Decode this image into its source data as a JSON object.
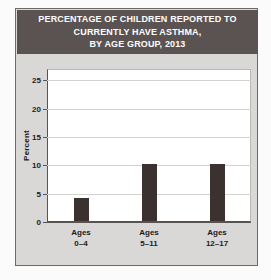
{
  "figure": {
    "title_lines": [
      "PERCENTAGE OF CHILDREN REPORTED TO",
      "CURRENTLY HAVE ASTHMA,",
      "BY AGE GROUP, 2013"
    ],
    "title_background_color": "#5a5352",
    "title_text_color": "#ffffff",
    "frame_background_color": "#d9d8d6",
    "plot_background_color": "#ffffff"
  },
  "chart_data": {
    "type": "bar",
    "title": "PERCENTAGE OF CHILDREN REPORTED TO CURRENTLY HAVE ASTHMA, BY AGE GROUP, 2013",
    "categories": [
      "Ages 0–4",
      "Ages 5–11",
      "Ages 12–17"
    ],
    "category_lines": [
      [
        "Ages",
        "0–4"
      ],
      [
        "Ages",
        "5–11"
      ],
      [
        "Ages",
        "12–17"
      ]
    ],
    "values": [
      4,
      10,
      10
    ],
    "xlabel": "",
    "ylabel": "Percent",
    "ylim": [
      0,
      27
    ],
    "yticks": [
      0,
      5,
      10,
      15,
      20,
      25
    ],
    "ytick_labels": [
      "0",
      "5",
      "10",
      "15",
      "20",
      "25"
    ],
    "grid": "horizontal",
    "legend": "none",
    "bar_color": "#3b3230"
  }
}
